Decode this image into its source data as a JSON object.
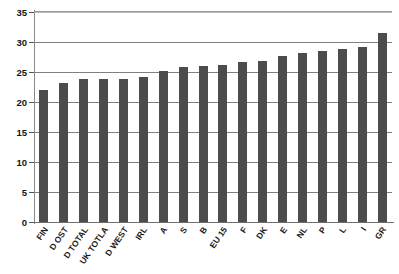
{
  "chart_data": {
    "type": "bar",
    "title": "",
    "xlabel": "",
    "ylabel": "",
    "ylim": [
      0,
      35
    ],
    "ytick_step": 5,
    "yticks": [
      35,
      30,
      25,
      20,
      15,
      10,
      5,
      0
    ],
    "grid": true,
    "legend": "none",
    "bar_color": "#4c4c4c",
    "categories": [
      "FIN",
      "D OST",
      "D TOTAL",
      "UK TOTLA",
      "D WEST",
      "IRL",
      "A",
      "S",
      "B",
      "EU 15",
      "F",
      "DK",
      "E",
      "NL",
      "P",
      "L",
      "I",
      "GR"
    ],
    "values": [
      22.0,
      23.2,
      23.8,
      23.8,
      23.9,
      24.1,
      25.2,
      25.8,
      26.0,
      26.1,
      26.6,
      26.9,
      27.6,
      28.2,
      28.5,
      28.8,
      29.2,
      31.5
    ]
  },
  "axis": {
    "ytick_labels": [
      "35",
      "30",
      "25",
      "20",
      "15",
      "10",
      "5",
      "0"
    ]
  }
}
